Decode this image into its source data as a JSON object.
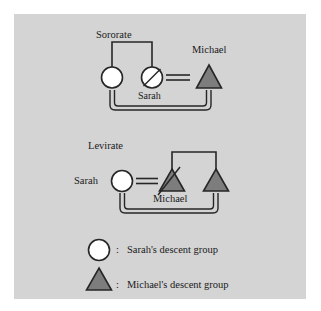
{
  "figure": {
    "panel_bg": "#d4d4d4",
    "page_bg": "#ffffff",
    "stroke": "#262626",
    "female_fill": "#ffffff",
    "male_fill": "#7d7d7d"
  },
  "sororate": {
    "title": "Sororate",
    "sister_label": "",
    "sarah_label": "Sarah",
    "michael_label": "Michael",
    "marriage_symbol": "=",
    "deceased_marker": "slash"
  },
  "levirate": {
    "title": "Levirate",
    "sarah_label": "Sarah",
    "michael_label": "Michael",
    "marriage_symbol": "=",
    "deceased_marker": "slash"
  },
  "legend": {
    "items": [
      {
        "symbol": "circle",
        "separator": ":",
        "label": "Sarah's descent group",
        "fill": "#ffffff"
      },
      {
        "symbol": "triangle",
        "separator": ":",
        "label": "Michael's descent group",
        "fill": "#7d7d7d"
      }
    ]
  }
}
